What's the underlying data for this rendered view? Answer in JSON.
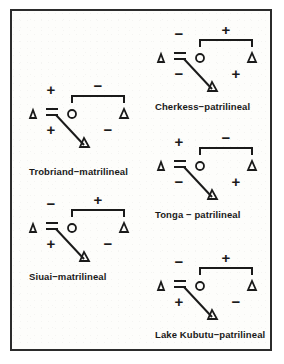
{
  "figure": {
    "type": "kinship-diagram-set",
    "border_color": "#2b2b2b",
    "background_color": "#fdfdfb",
    "ink_color": "#1a1a1a",
    "symbol_legend": {
      "triangle": "male",
      "circle": "female",
      "equals": "marriage link",
      "bracket": "sibling link",
      "diagonal": "descent link",
      "plus": "+",
      "minus": "−"
    }
  },
  "diagrams": [
    {
      "id": "trobriand",
      "caption": "Trobriand−matrilineal",
      "descent": "matrilineal",
      "signs": {
        "top_left": "+",
        "top_right": "−",
        "bottom_left": "+",
        "bottom_right": "−"
      },
      "nodes": {
        "father": "△",
        "mother": "○",
        "mothers_brother": "△",
        "ego": "△"
      }
    },
    {
      "id": "cherkess",
      "caption": "Cherkess−patrilineal",
      "descent": "patrilineal",
      "signs": {
        "top_left": "−",
        "top_right": "+",
        "bottom_left": "−",
        "bottom_right": "+"
      },
      "nodes": {
        "father": "△",
        "mother": "○",
        "mothers_brother": "△",
        "ego": "△"
      }
    },
    {
      "id": "siuai",
      "caption": "Siuai−matrilineal",
      "descent": "matrilineal",
      "signs": {
        "top_left": "−",
        "top_right": "+",
        "bottom_left": "+",
        "bottom_right": "−"
      },
      "nodes": {
        "father": "△",
        "mother": "○",
        "mothers_brother": "△",
        "ego": "△"
      }
    },
    {
      "id": "tonga",
      "caption": "Tonga − patrilineal",
      "descent": "patrilineal",
      "signs": {
        "top_left": "+",
        "top_right": "−",
        "bottom_left": "−",
        "bottom_right": "+"
      },
      "nodes": {
        "father": "△",
        "mother": "○",
        "mothers_brother": "△",
        "ego": "△"
      }
    },
    {
      "id": "lake-kubutu",
      "caption": "Lake Kubutu−patrilineal",
      "descent": "patrilineal",
      "signs": {
        "top_left": "−",
        "top_right": "+",
        "bottom_left": "+",
        "bottom_right": "−"
      },
      "nodes": {
        "father": "△",
        "mother": "○",
        "mothers_brother": "△",
        "ego": "△"
      }
    }
  ]
}
